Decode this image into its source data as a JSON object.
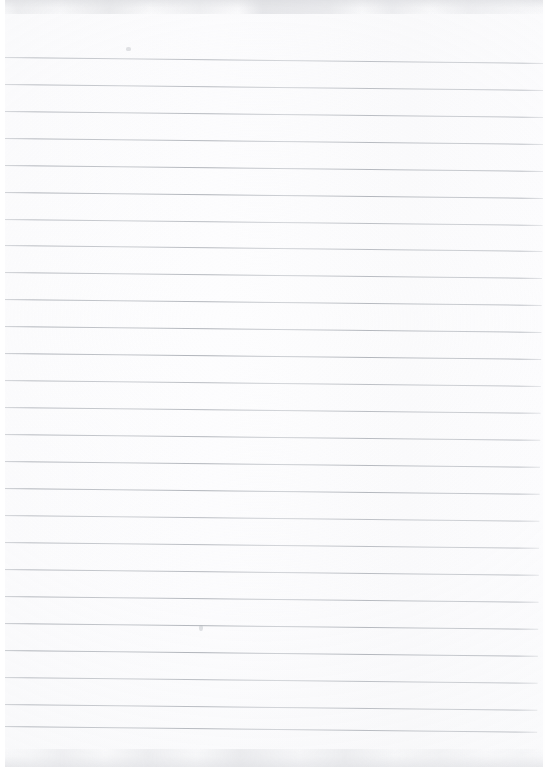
{
  "document": {
    "kind": "scanned-blank-lined-notebook-page",
    "title": "Blank lined notebook page",
    "description": "A scanned sheet of blank ruled notebook paper. No handwriting or printed text is present; only faint scanner smudges along the top and bottom edges and two small pencil specks.",
    "page_width_px": 545,
    "page_height_px": 767,
    "has_text_content": "false",
    "body_text": ""
  },
  "paper": {
    "background_color": "#fdfdfd",
    "sheet_color": "#ffffff",
    "left_margin_color": "#ffffff",
    "left_margin_width_px": 5,
    "right_margin_width_px": 2
  },
  "ruling": {
    "line_color": "#a9adb4",
    "line_thickness_px": 1,
    "line_spacing_px": 26.9,
    "first_line_y_px": 57,
    "line_count": 26,
    "line_left_x_px": 4,
    "line_right_x_px": 545,
    "skew_degrees": 0.62,
    "line_y_positions": [
      57,
      84,
      111,
      138,
      165,
      192,
      219,
      245,
      272,
      299,
      326,
      353,
      380,
      407,
      434,
      461,
      488,
      515,
      542,
      569,
      596,
      623,
      650,
      677,
      704,
      726
    ]
  },
  "artifacts": {
    "top_smudge": {
      "name": "scanner-smudge-top",
      "y_px": 0,
      "height_px": 14,
      "color": "#dcdee1"
    },
    "bottom_smudge": {
      "name": "scanner-smudge-bottom",
      "y_px": 749,
      "height_px": 18,
      "color": "#dcdee1"
    },
    "specks": [
      {
        "name": "pencil-speck-upper",
        "x_px": 126,
        "y_px": 47,
        "color": "#babdc2"
      },
      {
        "name": "pencil-speck-lower",
        "x_px": 199,
        "y_px": 625,
        "color": "#b4b8be"
      }
    ]
  }
}
